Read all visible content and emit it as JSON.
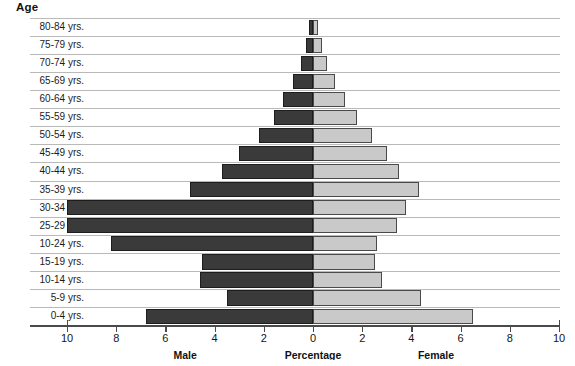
{
  "header": {
    "age_label": "Age"
  },
  "axis": {
    "tick_labels": [
      "10",
      "8",
      "6",
      "4",
      "2",
      "0",
      "2",
      "4",
      "6",
      "8",
      "10"
    ],
    "tick_values": [
      -10,
      -8,
      -6,
      -4,
      -2,
      0,
      2,
      4,
      6,
      8,
      10
    ],
    "male_label": "Male",
    "percentage_label": "Percentage",
    "female_label": "Female"
  },
  "colors": {
    "male_fill": "#3a3a3a",
    "female_fill": "#c9c9c9",
    "gridline": "#b9b9b9",
    "axis": "#4a4a4a",
    "background": "#ffffff"
  },
  "chart_data": {
    "type": "bar",
    "title": "",
    "subtitle": "",
    "orientation": "horizontal",
    "layout": "population-pyramid",
    "xlabel": "Percentage",
    "ylabel": "Age",
    "xlim": [
      -10,
      10
    ],
    "grid": true,
    "legend_position": "below-axis",
    "categories": [
      "80-84 yrs.",
      "75-79 yrs.",
      "70-74 yrs.",
      "65-69 yrs.",
      "60-64 yrs.",
      "55-59 yrs.",
      "50-54 yrs.",
      "45-49 yrs.",
      "40-44 yrs.",
      "35-39 yrs.",
      "30-34 yrs.",
      "25-29 yrs.",
      "10-24 yrs.",
      "15-19 yrs.",
      "10-14 yrs.",
      "5-9 yrs.",
      "0-4 yrs."
    ],
    "series": [
      {
        "name": "Male",
        "side": "left",
        "color": "#3a3a3a",
        "values": [
          0.15,
          0.3,
          0.5,
          0.8,
          1.2,
          1.6,
          2.2,
          3.0,
          3.7,
          5.0,
          10.0,
          10.0,
          8.2,
          4.5,
          4.6,
          3.5,
          6.8
        ]
      },
      {
        "name": "Female",
        "side": "right",
        "color": "#c9c9c9",
        "values": [
          0.2,
          0.35,
          0.55,
          0.9,
          1.3,
          1.8,
          2.4,
          3.0,
          3.5,
          4.3,
          3.8,
          3.4,
          2.6,
          2.5,
          2.8,
          4.4,
          6.5
        ]
      }
    ]
  }
}
